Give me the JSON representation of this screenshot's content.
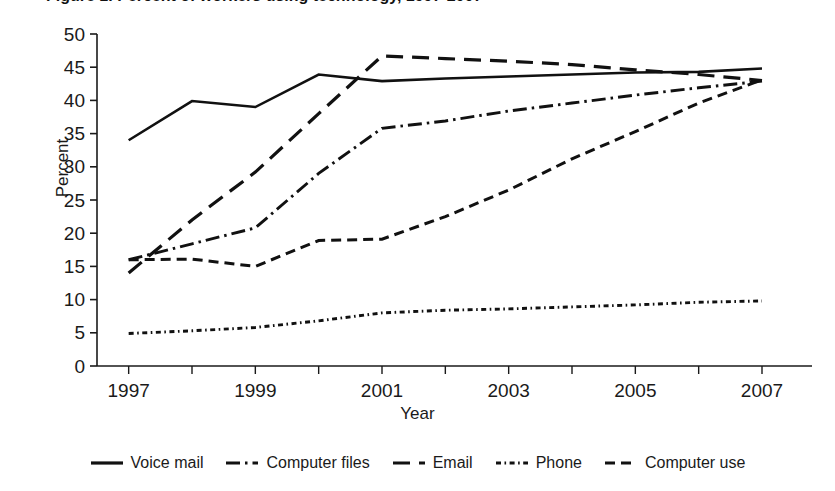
{
  "page": {
    "title_fragment_clipped": "Figure 1. Percent of workers using technology, 1997-2007"
  },
  "chart_data": {
    "type": "line",
    "title": "",
    "xlabel": "Year",
    "ylabel": "Percent",
    "x": [
      1997,
      1998,
      1999,
      2000,
      2001,
      2002,
      2003,
      2004,
      2005,
      2006,
      2007
    ],
    "xlim": [
      1996.5,
      2007.6
    ],
    "ylim": [
      0,
      50
    ],
    "yticks": [
      0,
      5,
      10,
      15,
      20,
      25,
      30,
      35,
      40,
      45,
      50
    ],
    "xticks": [
      1997,
      1998,
      1999,
      2000,
      2001,
      2002,
      2003,
      2004,
      2005,
      2006,
      2007
    ],
    "xticklabels": [
      "1997",
      "",
      "1999",
      "",
      "2001",
      "",
      "2003",
      "",
      "2005",
      "",
      "2007"
    ],
    "grid": false,
    "legend_position": "bottom",
    "series": [
      {
        "name": "Voice mail",
        "style": "solid",
        "values": [
          34.0,
          39.9,
          39.0,
          43.9,
          42.9,
          43.3,
          43.6,
          43.9,
          44.2,
          44.3,
          44.8
        ]
      },
      {
        "name": "Computer files",
        "style": "dash-dot",
        "values": [
          16.0,
          18.4,
          20.8,
          29.0,
          35.8,
          36.9,
          38.4,
          39.6,
          40.8,
          41.9,
          42.9
        ]
      },
      {
        "name": "Email",
        "style": "long-dash",
        "values": [
          14.0,
          22.0,
          29.2,
          38.0,
          46.7,
          46.3,
          45.9,
          45.4,
          44.6,
          43.9,
          43.0
        ]
      },
      {
        "name": "Phone",
        "style": "dotted",
        "values": [
          4.9,
          5.3,
          5.8,
          6.8,
          8.0,
          8.4,
          8.6,
          8.9,
          9.2,
          9.6,
          9.8
        ]
      },
      {
        "name": "Computer use",
        "style": "dash",
        "values": [
          16.0,
          16.1,
          15.0,
          18.9,
          19.1,
          22.5,
          26.5,
          31.2,
          35.3,
          39.6,
          43.1
        ]
      }
    ]
  },
  "axes": {
    "y_tick_labels": [
      "50",
      "45",
      "40",
      "35",
      "30",
      "25",
      "20",
      "15",
      "10",
      "5",
      "0"
    ],
    "x_tick_labels": [
      "1997",
      "1999",
      "2001",
      "2003",
      "2005",
      "2007"
    ],
    "axis_color": "#1a1a1a"
  },
  "legend": {
    "items": [
      {
        "label": "Voice mail",
        "style": "solid"
      },
      {
        "label": "Computer files",
        "style": "dash-dot"
      },
      {
        "label": "Email",
        "style": "long-dash"
      },
      {
        "label": "Phone",
        "style": "dotted"
      },
      {
        "label": "Computer use",
        "style": "dash"
      }
    ]
  }
}
